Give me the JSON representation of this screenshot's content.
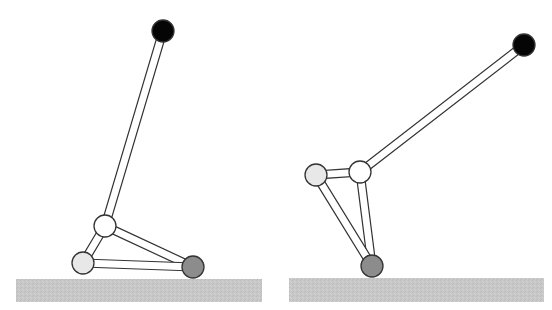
{
  "diagram": {
    "type": "linkage-mechanism",
    "colors": {
      "background": "#ffffff",
      "ground_fill": "#c8c8c8",
      "link_fill": "#ffffff",
      "outline": "#333333",
      "joint_top": "#050505",
      "joint_knee": "#ffffff",
      "joint_heel": "#e8e8e8",
      "joint_foot": "#8c8c8c"
    },
    "link_width": 8,
    "joint_radius": 11,
    "panels": [
      {
        "id": "left-pose",
        "ground": {
          "x": 16,
          "y": 279,
          "width": 246,
          "height": 23
        },
        "joints": {
          "top": {
            "x": 163,
            "y": 31
          },
          "knee": {
            "x": 105,
            "y": 226
          },
          "heel": {
            "x": 83,
            "y": 263
          },
          "foot": {
            "x": 193,
            "y": 267
          }
        },
        "links": [
          [
            "top",
            "knee"
          ],
          [
            "knee",
            "heel"
          ],
          [
            "knee",
            "foot"
          ],
          [
            "heel",
            "foot"
          ]
        ]
      },
      {
        "id": "right-pose",
        "ground": {
          "x": 289,
          "y": 278,
          "width": 255,
          "height": 24
        },
        "joints": {
          "top": {
            "x": 524,
            "y": 45
          },
          "knee": {
            "x": 360,
            "y": 172
          },
          "heel": {
            "x": 316,
            "y": 175
          },
          "foot": {
            "x": 372,
            "y": 266
          }
        },
        "links": [
          [
            "top",
            "knee"
          ],
          [
            "knee",
            "heel"
          ],
          [
            "knee",
            "foot"
          ],
          [
            "heel",
            "foot"
          ]
        ]
      }
    ]
  }
}
